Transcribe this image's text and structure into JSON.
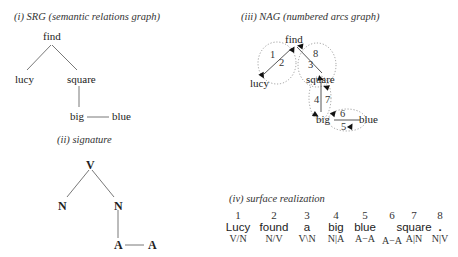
{
  "panels": {
    "srg": {
      "caption": "(i) SRG (semantic relations graph)",
      "nodes": {
        "find": "find",
        "lucy": "lucy",
        "square": "square",
        "big": "big",
        "blue": "blue"
      }
    },
    "signature": {
      "caption": "(ii) signature",
      "nodes": {
        "v": "V",
        "n1": "N",
        "n2": "N",
        "a1": "A",
        "a2": "A"
      }
    },
    "nag": {
      "caption": "(iii) NAG (numbered arcs graph)",
      "nodes": {
        "find": "find",
        "lucy": "lucy",
        "square": "square",
        "big": "big",
        "blue": "blue"
      },
      "arc_numbers": [
        "1",
        "2",
        "3",
        "4",
        "5",
        "6",
        "7",
        "8"
      ]
    },
    "surface": {
      "caption": "(iv) surface realization",
      "columns": [
        {
          "num": "1",
          "word": "Lucy",
          "sig": "V/N"
        },
        {
          "num": "2",
          "word": "found",
          "sig": "N/V"
        },
        {
          "num": "3",
          "word": "a",
          "sig": "V\\N"
        },
        {
          "num": "4",
          "word": "big",
          "sig": "N|A"
        },
        {
          "num": "5",
          "word": "blue",
          "sig": "A−A"
        },
        {
          "num": "6",
          "word": "",
          "sig": "A−A"
        },
        {
          "num": "7",
          "word": "square",
          "sig": "A|N"
        },
        {
          "num": "8",
          "word": ".",
          "sig": "N|V"
        }
      ]
    }
  }
}
